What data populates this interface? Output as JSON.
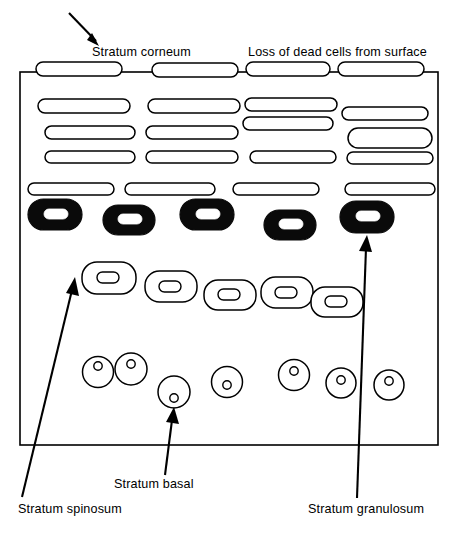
{
  "figure": {
    "page_corner_text": "",
    "background_color": "#ffffff",
    "ink_color": "#000000",
    "width": 455,
    "height": 539
  },
  "labels": {
    "corneum": "Stratum corneum",
    "loss": "Loss of dead cells from surface",
    "spinosum": "Stratum spinosum",
    "basal": "Stratum basal",
    "granulosum": "Stratum granulosum"
  },
  "layers": [
    {
      "name": "stratum-corneum",
      "label": "Stratum corneum",
      "description": "Flattened anucleate squames; topmost row straddles the frame edge and is shedding",
      "cell_style": "flat-outline-lozenge",
      "cell_count": 20
    },
    {
      "name": "stratum-granulosum",
      "label": "Stratum granulosum",
      "description": "Darkly stained granular cells with pale flattened nuclei",
      "cell_style": "filled-black-lozenge",
      "cell_count": 5
    },
    {
      "name": "stratum-spinosum",
      "label": "Stratum spinosum",
      "description": "Rounded polyhedral cells with oval nuclei, arranged in a descending step",
      "cell_style": "outline-rounded-with-oval-nucleus",
      "cell_count": 5
    },
    {
      "name": "stratum-basal",
      "label": "Stratum basal",
      "description": "Cuboidal germinative cells with small round nuclei resting on the base",
      "cell_style": "outline-circle-with-round-nucleus",
      "cell_count": 7
    }
  ],
  "annotations": [
    {
      "name": "corneum-annotation",
      "text": "Stratum corneum",
      "pointer": "arrow pointing down-right to the surface squame layer"
    },
    {
      "name": "loss-annotation",
      "text": "Loss of dead cells from surface",
      "pointer": "heading over the detaching surface cells"
    },
    {
      "name": "spinosum-annotation",
      "text": "Stratum spinosum",
      "pointer": "arrow pointing up-right to the first spinous cell"
    },
    {
      "name": "basal-annotation",
      "text": "Stratum basal",
      "pointer": "arrow pointing up to the basal cell row"
    },
    {
      "name": "granulosum-annotation",
      "text": "Stratum granulosum",
      "pointer": "long arrow pointing up to the dark granular cell"
    }
  ]
}
